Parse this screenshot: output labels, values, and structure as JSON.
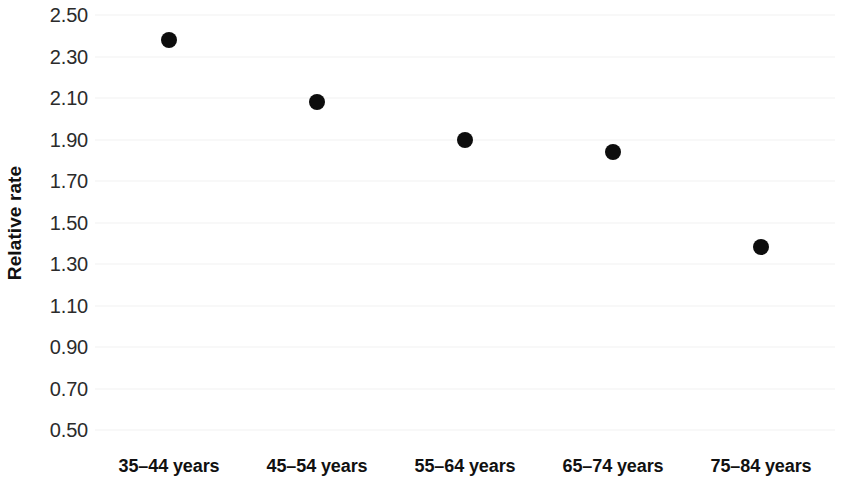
{
  "chart_data": {
    "type": "scatter",
    "title": "",
    "xlabel": "",
    "ylabel": "Relative rate",
    "categories": [
      "35–44 years",
      "45–54 years",
      "55–64 years",
      "65–74 years",
      "75–84 years"
    ],
    "values": [
      2.38,
      2.08,
      1.9,
      1.84,
      1.38
    ],
    "series": [
      {
        "name": "Relative rate",
        "values": [
          2.38,
          2.08,
          1.9,
          1.84,
          1.38
        ],
        "marker": "filled-circle",
        "color": "#0d0d0d"
      }
    ],
    "ylim": [
      0.5,
      2.5
    ],
    "ytick_step": 0.2,
    "ytick_labels": [
      "2.50",
      "2.30",
      "2.10",
      "1.90",
      "1.70",
      "1.50",
      "1.30",
      "1.10",
      "0.90",
      "0.70",
      "0.50"
    ],
    "ytick_values": [
      2.5,
      2.3,
      2.1,
      1.9,
      1.7,
      1.5,
      1.3,
      1.1,
      0.9,
      0.7,
      0.5
    ],
    "grid": true,
    "grid_color": "#f1f1f1",
    "legend": false,
    "legend_position": "none",
    "background_color": "#ffffff",
    "text_color": "#111111"
  }
}
